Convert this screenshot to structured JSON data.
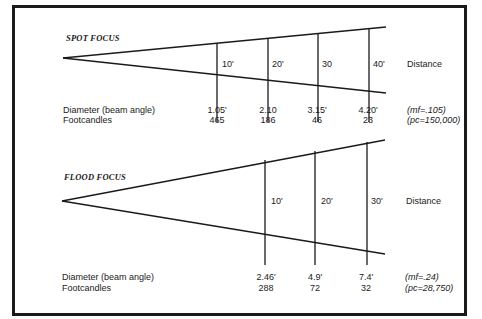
{
  "spot": {
    "title": "SPOT FOCUS",
    "distances": [
      "10'",
      "20'",
      "30",
      "40'"
    ],
    "distance_label": "Distance",
    "diameter_label": "Diameter (beam angle)",
    "footcandles_label": "Footcandles",
    "diameters": [
      "1.05'",
      "2.10",
      "3.15'",
      "4.20'"
    ],
    "footcandles": [
      "465",
      "186",
      "46",
      "23"
    ],
    "mf": "(mf=.105)",
    "pc": "(pc=150,000)"
  },
  "flood": {
    "title": "FLOOD FOCUS",
    "distances": [
      "10'",
      "20'",
      "30'"
    ],
    "distance_label": "Distance",
    "diameter_label": "Diameter (beam angle)",
    "footcandles_label": "Footcandles",
    "diameters": [
      "2.46'",
      "4.9'",
      "7.4'"
    ],
    "footcandles": [
      "288",
      "72",
      "32"
    ],
    "mf": "(mf=.24)",
    "pc": "(pc=28,750)"
  }
}
